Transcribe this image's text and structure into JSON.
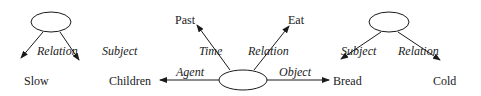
{
  "diagram": {
    "nodes": {
      "slow": "Slow",
      "children": "Children",
      "past": "Past",
      "eat": "Eat",
      "bread": "Bread",
      "cold": "Cold"
    },
    "edges": {
      "left_relation": "Relation",
      "left_subject": "Subject",
      "time": "Time",
      "center_relation": "Relation",
      "agent": "Agent",
      "object": "Object",
      "right_subject": "Subject",
      "right_relation": "Relation"
    },
    "colors": {
      "stroke": "#1a1a1a",
      "background": "#ffffff"
    }
  }
}
